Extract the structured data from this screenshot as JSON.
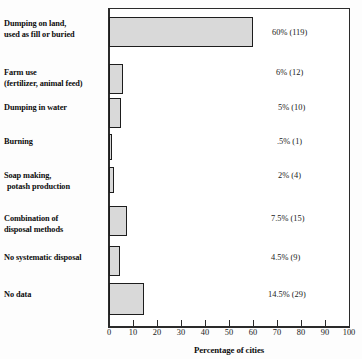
{
  "chart_data": {
    "type": "bar",
    "orientation": "horizontal",
    "title": "",
    "xlabel": "Percentage of cities",
    "ylabel": "",
    "xlim": [
      0,
      100
    ],
    "xticks": [
      0,
      10,
      20,
      30,
      40,
      50,
      60,
      70,
      80,
      90,
      100
    ],
    "grid": false,
    "legend": null,
    "categories": [
      "Dumping on land, used as fill or buried",
      "Farm use (fertilizer, animal feed)",
      "Dumping in water",
      "Burning",
      "Soap making, potash production",
      "Combination of disposal methods",
      "No systematic disposal",
      "No data"
    ],
    "values": [
      60,
      6,
      5,
      0.5,
      2,
      7.5,
      4.5,
      14.5
    ],
    "counts": [
      119,
      12,
      10,
      1,
      4,
      15,
      9,
      29
    ],
    "data_labels": [
      "60% (119)",
      "6% (12)",
      "5% (10)",
      ".5% (1)",
      "2% (4)",
      "7.5% (15)",
      "4.5% (9)",
      "14.5% (29)"
    ],
    "bar_color": "#d9d9d9",
    "bar_edge_color": "#1d1d1d",
    "axis_color": "#2b2b2b"
  },
  "rows": [
    {
      "label_line1": "Dumping on land,",
      "label_line2": "used as fill or buried",
      "label_indent2": false,
      "value_label": "60% (119)",
      "value": 60
    },
    {
      "label_line1": "Farm use",
      "label_line2": "(fertilizer, animal feed)",
      "label_indent2": false,
      "value_label": "6% (12)",
      "value": 6
    },
    {
      "label_line1": "Dumping in water",
      "label_line2": "",
      "label_indent2": false,
      "value_label": "5% (10)",
      "value": 5
    },
    {
      "label_line1": "Burning",
      "label_line2": "",
      "label_indent2": false,
      "value_label": ".5% (1)",
      "value": 0.5
    },
    {
      "label_line1": "Soap making,",
      "label_line2": "potash production",
      "label_indent2": true,
      "value_label": "2% (4)",
      "value": 2
    },
    {
      "label_line1": "Combination of",
      "label_line2": "disposal methods",
      "label_indent2": false,
      "value_label": "7.5% (15)",
      "value": 7.5
    },
    {
      "label_line1": "No systematic disposal",
      "label_line2": "",
      "label_indent2": false,
      "value_label": "4.5% (9)",
      "value": 4.5
    },
    {
      "label_line1": "No data",
      "label_line2": "",
      "label_indent2": false,
      "value_label": "14.5% (29)",
      "value": 14.5
    }
  ],
  "axis": {
    "title": "Percentage of cities",
    "ticks": [
      "0",
      "10",
      "20",
      "30",
      "40",
      "50",
      "60",
      "70",
      "80",
      "90",
      "100"
    ]
  }
}
